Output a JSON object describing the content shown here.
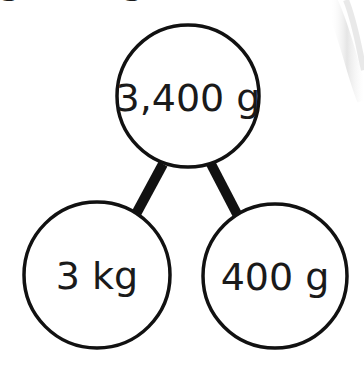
{
  "diagram": {
    "type": "number-bond",
    "whole": {
      "label": "3,400 g",
      "cx": 188,
      "cy": 96,
      "r": 71
    },
    "parts": [
      {
        "label": "3 kg",
        "cx": 97,
        "cy": 275,
        "r": 73
      },
      {
        "label": "400 g",
        "cx": 275,
        "cy": 276,
        "r": 72
      }
    ],
    "connectors": [
      {
        "x1": 163,
        "y1": 164,
        "x2": 136,
        "y2": 214
      },
      {
        "x1": 211,
        "y1": 164,
        "x2": 237,
        "y2": 214
      }
    ],
    "top_cut_text": [
      "g",
      "g"
    ],
    "colors": {
      "stroke": "#111111",
      "text": "#1a1a1a",
      "background": "#ffffff",
      "decor_shadow": "#d9d9d9"
    }
  }
}
